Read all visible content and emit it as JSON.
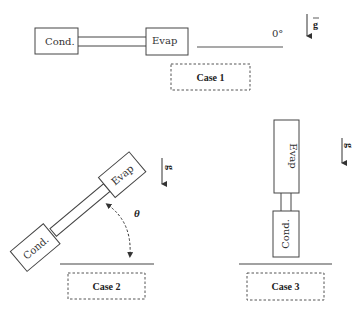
{
  "diagram": {
    "gravity_label": "g",
    "case1": {
      "label": "Case 1",
      "condenser": "Cond.",
      "evaporator": "Evap",
      "angle_label": "0°",
      "orientation": "horizontal"
    },
    "case2": {
      "label": "Case 2",
      "condenser": "Cond.",
      "evaporator": "Evap",
      "angle_label": "θ",
      "orientation": "inclined"
    },
    "case3": {
      "label": "Case 3",
      "condenser": "Cond.",
      "evaporator": "Evap",
      "orientation": "vertical"
    },
    "colors": {
      "stroke": "#444444",
      "dashed": "#555555",
      "text": "#333333"
    }
  }
}
